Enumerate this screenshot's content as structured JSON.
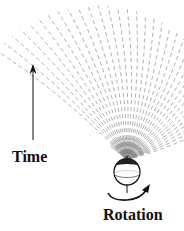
{
  "diagram": {
    "labels": {
      "time": "Time",
      "rotation": "Rotation"
    },
    "colors": {
      "trajectory": "#9a9a9a",
      "ink": "#111111",
      "background": "#ffffff"
    },
    "sphere": {
      "cx": 127,
      "cy": 172,
      "r": 13
    },
    "fan": {
      "origin": {
        "x": 127,
        "y": 160
      },
      "line_count": 34,
      "start_angle_deg": -140,
      "end_angle_deg": -22,
      "length_min": 95,
      "length_max": 170
    },
    "time_arrow": {
      "x": 33,
      "y_top": 64,
      "y_bottom": 140
    }
  }
}
